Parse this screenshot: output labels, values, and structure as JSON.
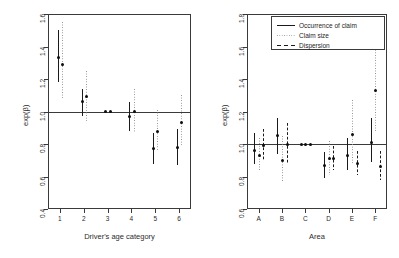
{
  "figure": {
    "panels": [
      {
        "id": "left",
        "xlabel": "Driver's age category",
        "ylabel": "exp(β)",
        "ylim": [
          0.4,
          1.6
        ],
        "yticks": [
          "0.4",
          "0.6",
          "0.8",
          "1.0",
          "1.2",
          "1.4",
          "1.6"
        ],
        "ytickvals": [
          0.4,
          0.6,
          0.8,
          1.0,
          1.2,
          1.4,
          1.6
        ],
        "categories": [
          "1",
          "2",
          "3",
          "4",
          "5",
          "6"
        ],
        "refline": 1.0,
        "has_legend": false
      },
      {
        "id": "right",
        "xlabel": "Area",
        "ylabel": "exp(β)",
        "ylim": [
          0.6,
          1.8
        ],
        "yticks": [
          "0.6",
          "0.8",
          "1.0",
          "1.2",
          "1.4",
          "1.6",
          "1.8"
        ],
        "ytickvals": [
          0.6,
          0.8,
          1.0,
          1.2,
          1.4,
          1.6,
          1.8
        ],
        "categories": [
          "A",
          "B",
          "C",
          "D",
          "E",
          "F"
        ],
        "refline": 1.0,
        "has_legend": true
      }
    ],
    "legend": {
      "items": [
        {
          "label": "Occurrence of claim",
          "style": "solid"
        },
        {
          "label": "Claim size",
          "style": "dotted"
        },
        {
          "label": "Dispersion",
          "style": "dashed"
        }
      ]
    }
  },
  "chart_data": [
    {
      "type": "scatter",
      "panel": "left",
      "title": "",
      "xlabel": "Driver's age category",
      "ylabel": "exp(β)",
      "ylim": [
        0.4,
        1.6
      ],
      "yticks": [
        0.4,
        0.6,
        0.8,
        1.0,
        1.2,
        1.4,
        1.6
      ],
      "grid": false,
      "reference_line": 1.0,
      "categories": [
        "1",
        "2",
        "3",
        "4",
        "5",
        "6"
      ],
      "series": [
        {
          "name": "Occurrence of claim",
          "style": "solid",
          "estimates": [
            1.33,
            1.06,
            1.0,
            0.97,
            0.77,
            0.78
          ],
          "lower": [
            1.18,
            0.97,
            1.0,
            0.88,
            0.68,
            0.67
          ],
          "upper": [
            1.5,
            1.14,
            1.0,
            1.06,
            0.87,
            0.89
          ]
        },
        {
          "name": "Claim size",
          "style": "dotted",
          "estimates": [
            1.29,
            1.09,
            1.0,
            1.0,
            0.88,
            0.93
          ],
          "lower": [
            1.08,
            0.94,
            1.0,
            0.87,
            0.76,
            0.79
          ],
          "upper": [
            1.55,
            1.25,
            1.0,
            1.14,
            1.01,
            1.1
          ]
        }
      ]
    },
    {
      "type": "scatter",
      "panel": "right",
      "title": "",
      "xlabel": "Area",
      "ylabel": "exp(β)",
      "ylim": [
        0.6,
        1.8
      ],
      "yticks": [
        0.6,
        0.8,
        1.0,
        1.2,
        1.4,
        1.6,
        1.8
      ],
      "grid": false,
      "reference_line": 1.0,
      "categories": [
        "A",
        "B",
        "C",
        "D",
        "E",
        "F"
      ],
      "series": [
        {
          "name": "Occurrence of claim",
          "style": "solid",
          "estimates": [
            0.96,
            1.05,
            1.0,
            0.87,
            0.93,
            1.01
          ],
          "lower": [
            0.88,
            0.94,
            1.0,
            0.79,
            0.84,
            0.89
          ],
          "upper": [
            1.07,
            1.16,
            1.0,
            0.95,
            1.04,
            1.16
          ]
        },
        {
          "name": "Claim size",
          "style": "dotted",
          "estimates": [
            0.93,
            0.9,
            1.0,
            0.91,
            1.06,
            1.33
          ],
          "lower": [
            0.84,
            0.77,
            1.0,
            0.81,
            0.88,
            1.08
          ],
          "upper": [
            1.04,
            1.05,
            1.0,
            1.02,
            1.27,
            1.63
          ]
        },
        {
          "name": "Dispersion",
          "style": "dashed",
          "estimates": [
            0.99,
            1.0,
            1.0,
            0.91,
            0.88,
            0.86
          ],
          "lower": [
            0.9,
            0.88,
            1.0,
            0.84,
            0.81,
            0.78
          ],
          "upper": [
            1.09,
            1.13,
            1.0,
            0.99,
            0.96,
            0.96
          ]
        }
      ]
    }
  ]
}
